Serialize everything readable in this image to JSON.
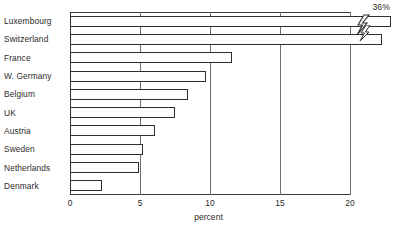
{
  "chart_data": {
    "type": "bar",
    "orientation": "horizontal",
    "title": "",
    "xlabel": "percent",
    "ylabel": "",
    "categories": [
      "Luxembourg",
      "Switzerland",
      "France",
      "W. Germany",
      "Belgium",
      "UK",
      "Austria",
      "Sweden",
      "Netherlands",
      "Denmark"
    ],
    "values": [
      36,
      22.3,
      11.6,
      9.7,
      8.4,
      7.5,
      6.1,
      5.2,
      4.9,
      2.3
    ],
    "drawn_values": [
      22.9,
      22.3,
      11.6,
      9.7,
      8.4,
      7.5,
      6.1,
      5.2,
      4.9,
      2.3
    ],
    "xlim": [
      0,
      20
    ],
    "xticks": [
      0,
      5,
      10,
      15,
      20
    ],
    "xtick_labels": [
      "0",
      "5",
      "10",
      "15",
      "20"
    ],
    "grid": true,
    "legend": false,
    "annotations": [
      {
        "text": "36%",
        "category": "Luxembourg",
        "note": "axis-break value label above Luxembourg bar"
      }
    ],
    "axis_break": {
      "symbol": "lightning-bolt-zigzag",
      "at_value": 20.7,
      "applies_to": [
        "Luxembourg",
        "Switzerland"
      ]
    },
    "colors": {
      "bar_fill": "#fdfdfd",
      "bar_stroke": "#2d2d2d",
      "grid": "#6e6e6e",
      "axis": "#3a3a3a",
      "text": "#2b2b2b"
    }
  },
  "axis": {
    "x_title": "percent"
  }
}
